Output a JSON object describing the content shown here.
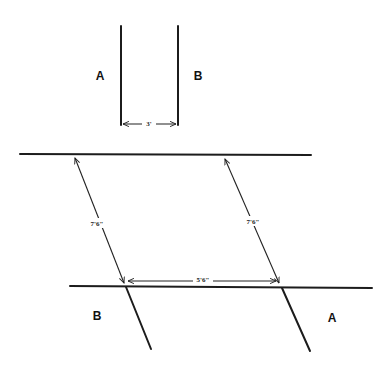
{
  "figure": {
    "top_panel": {
      "label_left": "A",
      "label_right": "B",
      "gap_dimension": "3'"
    },
    "bottom_panel": {
      "label_left": "B",
      "label_right": "A",
      "left_slant_dimension": "7'6\"",
      "right_slant_dimension": "7'6\"",
      "horizontal_dimension": "5'6\""
    },
    "colors": {
      "ink": "#1c1c1c",
      "background": "#ffffff"
    }
  }
}
